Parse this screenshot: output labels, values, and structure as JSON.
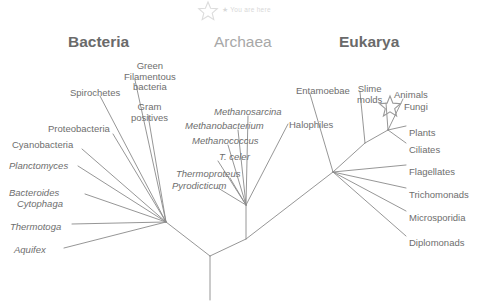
{
  "figure": {
    "type": "phylogenetic-tree",
    "background_color": "#ffffff",
    "branch_color": "#8a8a8a",
    "label_color": "#6e6e6e",
    "muted_color": "#a8a8a8",
    "faint_color": "#d8d8d8"
  },
  "annotation": {
    "you_are_here": "★ You are here",
    "star_icon": "star-icon"
  },
  "domains": [
    {
      "id": "bacteria",
      "label": "Bacteria",
      "x": 68,
      "y": 33,
      "style": "bold"
    },
    {
      "id": "archaea",
      "label": "Archaea",
      "x": 214,
      "y": 33,
      "style": "light"
    },
    {
      "id": "eukarya",
      "label": "Eukarya",
      "x": 339,
      "y": 33,
      "style": "bold"
    }
  ],
  "taxa": {
    "bacteria": [
      {
        "id": "spirochetes",
        "label": "Spirochetes",
        "italic": false,
        "x": 70,
        "y": 88,
        "align": "left"
      },
      {
        "id": "green-filamentous",
        "label": "Green\nFilamentous\nbacteria",
        "italic": false,
        "x": 124,
        "y": 61,
        "align": "center"
      },
      {
        "id": "gram-positives",
        "label": "Gram\npositives",
        "italic": false,
        "x": 131,
        "y": 102,
        "align": "center"
      },
      {
        "id": "proteobacteria",
        "label": "Proteobacteria",
        "italic": false,
        "x": 48,
        "y": 124,
        "align": "left"
      },
      {
        "id": "cyanobacteria",
        "label": "Cyanobacteria",
        "italic": false,
        "x": 12,
        "y": 140,
        "align": "left"
      },
      {
        "id": "planctomyces",
        "label": "Planctomyces",
        "italic": true,
        "x": 9,
        "y": 161,
        "align": "left"
      },
      {
        "id": "bacteroides",
        "label": "Bacteroides",
        "italic": true,
        "x": 9,
        "y": 188,
        "align": "left"
      },
      {
        "id": "cytophaga",
        "label": "Cytophaga",
        "italic": true,
        "x": 17,
        "y": 199,
        "align": "left"
      },
      {
        "id": "thermotoga",
        "label": "Thermotoga",
        "italic": true,
        "x": 10,
        "y": 222,
        "align": "left"
      },
      {
        "id": "aquifex",
        "label": "Aquifex",
        "italic": true,
        "x": 14,
        "y": 245,
        "align": "left"
      }
    ],
    "archaea": [
      {
        "id": "methanosarcina",
        "label": "Methanosarcina",
        "italic": true,
        "x": 214,
        "y": 107,
        "align": "left"
      },
      {
        "id": "methanobacterium",
        "label": "Methanobacterium",
        "italic": true,
        "x": 185,
        "y": 121,
        "align": "left"
      },
      {
        "id": "methanococcus",
        "label": "Methanococcus",
        "italic": true,
        "x": 192,
        "y": 136,
        "align": "left"
      },
      {
        "id": "t-celer",
        "label": "T. celer",
        "italic": true,
        "x": 219,
        "y": 152,
        "align": "left"
      },
      {
        "id": "thermoproteus",
        "label": "Thermoproteus",
        "italic": true,
        "x": 176,
        "y": 169,
        "align": "left"
      },
      {
        "id": "pyrodicticum",
        "label": "Pyrodicticum",
        "italic": true,
        "x": 172,
        "y": 181,
        "align": "left"
      },
      {
        "id": "halophiles",
        "label": "Halophiles",
        "italic": false,
        "x": 289,
        "y": 120,
        "align": "left"
      }
    ],
    "eukarya": [
      {
        "id": "entamoebae",
        "label": "Entamoebae",
        "italic": false,
        "x": 296,
        "y": 86,
        "align": "left"
      },
      {
        "id": "slime-molds",
        "label": "Slime\nmolds",
        "italic": false,
        "x": 357,
        "y": 84,
        "align": "center"
      },
      {
        "id": "animals",
        "label": "Animals",
        "italic": false,
        "x": 394,
        "y": 90,
        "align": "left"
      },
      {
        "id": "fungi",
        "label": "Fungi",
        "italic": false,
        "x": 404,
        "y": 102,
        "align": "left"
      },
      {
        "id": "plants",
        "label": "Plants",
        "italic": false,
        "x": 409,
        "y": 128,
        "align": "left"
      },
      {
        "id": "ciliates",
        "label": "Ciliates",
        "italic": false,
        "x": 409,
        "y": 145,
        "align": "left"
      },
      {
        "id": "flagellates",
        "label": "Flagellates",
        "italic": false,
        "x": 409,
        "y": 167,
        "align": "left"
      },
      {
        "id": "trichomonads",
        "label": "Trichomonads",
        "italic": false,
        "x": 409,
        "y": 190,
        "align": "left"
      },
      {
        "id": "microsporidia",
        "label": "Microsporidia",
        "italic": false,
        "x": 409,
        "y": 213,
        "align": "left"
      },
      {
        "id": "diplomonads",
        "label": "Diplomonads",
        "italic": false,
        "x": 409,
        "y": 238,
        "align": "left"
      }
    ]
  },
  "tree_geometry": {
    "root": {
      "x": 210,
      "y": 300
    },
    "trunk_top": {
      "x": 210,
      "y": 256
    },
    "bacteria_node": {
      "x": 166,
      "y": 222
    },
    "arch_euk_node": {
      "x": 246,
      "y": 239
    },
    "archaea_node": {
      "x": 246,
      "y": 205
    },
    "eukarya_node": {
      "x": 333,
      "y": 172
    },
    "eukarya_crown": {
      "x": 388,
      "y": 130
    },
    "branches": [
      [
        "210,300",
        "210,256"
      ],
      [
        "210,256",
        "166,222"
      ],
      [
        "210,256",
        "246,239"
      ],
      [
        "246,239",
        "246,205"
      ],
      [
        "246,239",
        "333,172"
      ],
      [
        "166,222",
        "100,96"
      ],
      [
        "166,222",
        "135,80"
      ],
      [
        "166,222",
        "148,115"
      ],
      [
        "166,222",
        "113,134"
      ],
      [
        "166,222",
        "82,149"
      ],
      [
        "166,222",
        "78,166"
      ],
      [
        "166,222",
        "85,194"
      ],
      [
        "166,222",
        "72,224"
      ],
      [
        "166,222",
        "64,248"
      ],
      [
        "246,205",
        "248,116"
      ],
      [
        "246,205",
        "238,130"
      ],
      [
        "246,205",
        "228,145"
      ],
      [
        "246,205",
        "218,161"
      ],
      [
        "246,205",
        "230,178"
      ],
      [
        "246,205",
        "218,188"
      ],
      [
        "246,205",
        "288,124"
      ],
      [
        "333,172",
        "310,94"
      ],
      [
        "333,172",
        "365,143"
      ],
      [
        "365,143",
        "360,92"
      ],
      [
        "365,143",
        "388,130"
      ],
      [
        "388,130",
        "386,103"
      ],
      [
        "388,130",
        "403,99"
      ],
      [
        "388,130",
        "406,126"
      ],
      [
        "388,130",
        "406,143"
      ],
      [
        "333,172",
        "406,165"
      ],
      [
        "333,172",
        "406,188"
      ],
      [
        "333,172",
        "406,211"
      ],
      [
        "333,172",
        "406,236"
      ]
    ]
  }
}
